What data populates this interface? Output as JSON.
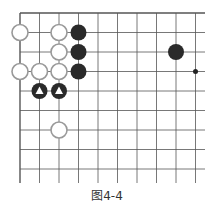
{
  "caption": "图4-4",
  "board": {
    "origin": [
      20,
      13
    ],
    "spacing": 19.5,
    "cols": 10,
    "rows": 9,
    "hoshi": [
      [
        9,
        3
      ]
    ],
    "white_stones": [
      [
        0,
        1
      ],
      [
        2,
        1
      ],
      [
        2,
        2
      ],
      [
        0,
        3
      ],
      [
        1,
        3
      ],
      [
        2,
        3
      ],
      [
        2,
        6
      ]
    ],
    "black_stones": [
      [
        3,
        1
      ],
      [
        3,
        2
      ],
      [
        3,
        3
      ],
      [
        8,
        2
      ]
    ],
    "black_marked_triangle": [
      [
        1,
        4
      ],
      [
        2,
        4
      ]
    ]
  },
  "colors": {
    "line": "#555555",
    "black": "#2a2a2a",
    "white_fill": "#ffffff",
    "white_stroke": "#999999"
  }
}
